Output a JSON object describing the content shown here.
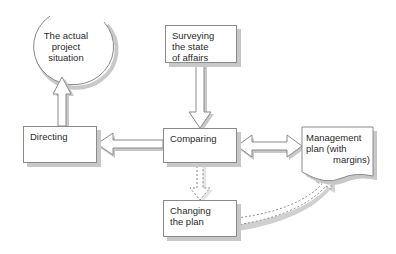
{
  "diagram": {
    "nodes": {
      "situation": {
        "label": "The actual\nproject\nsituation",
        "shape": "circle"
      },
      "surveying": {
        "label": "Surveying\nthe state\nof affairs",
        "shape": "box"
      },
      "comparing": {
        "label": "Comparing",
        "shape": "box"
      },
      "directing": {
        "label": "Directing",
        "shape": "box"
      },
      "management_plan": {
        "line1": "Management",
        "line2": "plan (with",
        "line3": "margins)",
        "shape": "document"
      },
      "changing": {
        "label": "Changing\nthe plan",
        "shape": "box"
      }
    },
    "edges": [
      {
        "from": "surveying",
        "to": "comparing",
        "style": "solid"
      },
      {
        "from": "comparing",
        "to": "directing",
        "style": "solid"
      },
      {
        "from": "directing",
        "to": "situation",
        "style": "solid"
      },
      {
        "from": "comparing",
        "to": "management_plan",
        "style": "solid",
        "bidirectional": true
      },
      {
        "from": "comparing",
        "to": "changing",
        "style": "dashed"
      },
      {
        "from": "changing",
        "to": "management_plan",
        "style": "dashed",
        "curved": true
      }
    ],
    "colors": {
      "stroke": "#8a8a8a",
      "shadow": "#c8c8c8",
      "text": "#2a2a2a",
      "fill": "#ffffff"
    }
  }
}
